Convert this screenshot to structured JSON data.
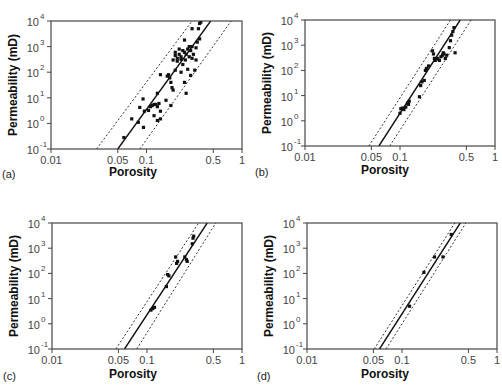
{
  "figure": {
    "panels": [
      {
        "id": "a",
        "label": "(a)",
        "box": {
          "left": 51,
          "top": 21,
          "right": 242,
          "bottom": 149
        },
        "label_pos": {
          "x": 2,
          "y": 178
        },
        "xtitle_pos": {
          "x": 133,
          "y": 176
        }
      },
      {
        "id": "b",
        "label": "(b)",
        "box": {
          "left": 305,
          "top": 20,
          "right": 495,
          "bottom": 146
        },
        "label_pos": {
          "x": 255,
          "y": 176
        },
        "xtitle_pos": {
          "x": 385,
          "y": 174
        }
      },
      {
        "id": "c",
        "label": "(c)",
        "box": {
          "left": 52,
          "top": 223,
          "right": 242,
          "bottom": 349
        },
        "label_pos": {
          "x": 3,
          "y": 380
        },
        "xtitle_pos": {
          "x": 133,
          "y": 378
        }
      },
      {
        "id": "d",
        "label": "(d)",
        "box": {
          "left": 307,
          "top": 223,
          "right": 497,
          "bottom": 349
        },
        "label_pos": {
          "x": 257,
          "y": 380
        },
        "xtitle_pos": {
          "x": 385,
          "y": 378
        }
      }
    ]
  },
  "chart_data": [
    {
      "type": "scatter",
      "panel": "(a)",
      "title": "",
      "xlabel": "Porosity",
      "ylabel": "Permeability (mD)",
      "xscale": "log",
      "yscale": "log",
      "xlim": [
        0.01,
        1
      ],
      "ylim": [
        0.1,
        10000
      ],
      "xticks": [
        0.01,
        0.05,
        0.1,
        0.5,
        1
      ],
      "xtick_labels": [
        "0.01",
        "0.05",
        "0.1",
        "0.5",
        "1"
      ],
      "yticks": [
        0.1,
        1,
        10,
        100,
        1000,
        10000
      ],
      "ytick_labels": [
        {
          "base": "10",
          "exp": "-1"
        },
        {
          "base": "10",
          "exp": "0"
        },
        {
          "base": "10",
          "exp": "1"
        },
        {
          "base": "10",
          "exp": "2"
        },
        {
          "base": "10",
          "exp": "3"
        },
        {
          "base": "10",
          "exp": "4"
        }
      ],
      "grid": false,
      "fit_line": {
        "points": [
          [
            0.05,
            0.1
          ],
          [
            0.47,
            10000
          ]
        ],
        "style": "solid"
      },
      "bounds": [
        {
          "points": [
            [
              0.03,
              0.1
            ],
            [
              0.3,
              10000
            ]
          ],
          "style": "dotted"
        },
        {
          "points": [
            [
              0.085,
              0.1
            ],
            [
              0.77,
              10000
            ]
          ],
          "style": "dotted"
        }
      ],
      "points": [
        [
          0.058,
          0.28
        ],
        [
          0.07,
          1.5
        ],
        [
          0.082,
          1.1
        ],
        [
          0.085,
          4.2
        ],
        [
          0.092,
          9
        ],
        [
          0.093,
          0.7
        ],
        [
          0.095,
          3
        ],
        [
          0.105,
          3.2
        ],
        [
          0.11,
          4.5
        ],
        [
          0.115,
          5
        ],
        [
          0.12,
          2
        ],
        [
          0.12,
          5.5
        ],
        [
          0.125,
          5.5
        ],
        [
          0.13,
          15
        ],
        [
          0.13,
          1.3
        ],
        [
          0.13,
          4.5
        ],
        [
          0.135,
          6
        ],
        [
          0.14,
          1.5
        ],
        [
          0.14,
          3
        ],
        [
          0.14,
          80
        ],
        [
          0.16,
          8
        ],
        [
          0.165,
          70
        ],
        [
          0.17,
          80
        ],
        [
          0.175,
          60
        ],
        [
          0.18,
          40
        ],
        [
          0.18,
          5
        ],
        [
          0.185,
          25
        ],
        [
          0.19,
          20
        ],
        [
          0.19,
          300
        ],
        [
          0.2,
          450
        ],
        [
          0.2,
          600
        ],
        [
          0.2,
          120
        ],
        [
          0.21,
          350
        ],
        [
          0.21,
          270
        ],
        [
          0.22,
          500
        ],
        [
          0.22,
          800
        ],
        [
          0.23,
          400
        ],
        [
          0.23,
          320
        ],
        [
          0.23,
          100
        ],
        [
          0.24,
          200
        ],
        [
          0.24,
          700
        ],
        [
          0.25,
          1800
        ],
        [
          0.25,
          600
        ],
        [
          0.25,
          40
        ],
        [
          0.255,
          300
        ],
        [
          0.26,
          500
        ],
        [
          0.26,
          15
        ],
        [
          0.27,
          130
        ],
        [
          0.27,
          800
        ],
        [
          0.28,
          1000
        ],
        [
          0.28,
          400
        ],
        [
          0.29,
          700
        ],
        [
          0.29,
          75
        ],
        [
          0.3,
          5000
        ],
        [
          0.3,
          1000
        ],
        [
          0.3,
          350
        ],
        [
          0.31,
          500
        ],
        [
          0.32,
          120
        ],
        [
          0.33,
          300
        ],
        [
          0.33,
          900
        ],
        [
          0.34,
          1500
        ],
        [
          0.35,
          5000
        ],
        [
          0.36,
          8000
        ],
        [
          0.37,
          9000
        ],
        [
          0.36,
          2000
        ]
      ]
    },
    {
      "type": "scatter",
      "panel": "(b)",
      "xlabel": "Porosity",
      "ylabel": "Permeability (mD)",
      "xscale": "log",
      "yscale": "log",
      "xlim": [
        0.01,
        1
      ],
      "ylim": [
        0.1,
        10000
      ],
      "xticks": [
        0.01,
        0.05,
        0.1,
        0.5,
        1
      ],
      "xtick_labels": [
        "0.01",
        "0.05",
        "0.1",
        "0.5",
        "1"
      ],
      "yticks": [
        0.1,
        1,
        10,
        100,
        1000,
        10000
      ],
      "ytick_labels": [
        {
          "base": "10",
          "exp": "-1"
        },
        {
          "base": "10",
          "exp": "0"
        },
        {
          "base": "10",
          "exp": "1"
        },
        {
          "base": "10",
          "exp": "2"
        },
        {
          "base": "10",
          "exp": "3"
        },
        {
          "base": "10",
          "exp": "4"
        }
      ],
      "grid": false,
      "fit_line": {
        "points": [
          [
            0.06,
            0.1
          ],
          [
            0.43,
            10000
          ]
        ],
        "style": "solid"
      },
      "bounds": [
        {
          "points": [
            [
              0.047,
              0.1
            ],
            [
              0.34,
              10000
            ]
          ],
          "style": "dotted"
        },
        {
          "points": [
            [
              0.078,
              0.1
            ],
            [
              0.56,
              10000
            ]
          ],
          "style": "dotted"
        }
      ],
      "points": [
        [
          0.1,
          2
        ],
        [
          0.102,
          3
        ],
        [
          0.106,
          3.2
        ],
        [
          0.11,
          2.8
        ],
        [
          0.115,
          3.5
        ],
        [
          0.12,
          5
        ],
        [
          0.123,
          4.5
        ],
        [
          0.125,
          6
        ],
        [
          0.16,
          9
        ],
        [
          0.165,
          25
        ],
        [
          0.17,
          35
        ],
        [
          0.18,
          40
        ],
        [
          0.185,
          100
        ],
        [
          0.19,
          120
        ],
        [
          0.2,
          150
        ],
        [
          0.22,
          600
        ],
        [
          0.225,
          450
        ],
        [
          0.23,
          300
        ],
        [
          0.235,
          250
        ],
        [
          0.24,
          280
        ],
        [
          0.25,
          300
        ],
        [
          0.26,
          250
        ],
        [
          0.27,
          350
        ],
        [
          0.28,
          400
        ],
        [
          0.285,
          500
        ],
        [
          0.29,
          450
        ],
        [
          0.3,
          300
        ],
        [
          0.31,
          400
        ],
        [
          0.33,
          800
        ],
        [
          0.34,
          1500
        ],
        [
          0.35,
          2500
        ],
        [
          0.36,
          3500
        ],
        [
          0.37,
          5000
        ],
        [
          0.38,
          500
        ]
      ]
    },
    {
      "type": "scatter",
      "panel": "(c)",
      "xlabel": "Porosity",
      "ylabel": "Permeability (mD)",
      "xscale": "log",
      "yscale": "log",
      "xlim": [
        0.01,
        1
      ],
      "ylim": [
        0.1,
        10000
      ],
      "xticks": [
        0.01,
        0.05,
        0.1,
        0.5,
        1
      ],
      "xtick_labels": [
        "0.01",
        "0.05",
        "0.1",
        "0.5",
        "1"
      ],
      "yticks": [
        0.1,
        1,
        10,
        100,
        1000,
        10000
      ],
      "ytick_labels": [
        {
          "base": "10",
          "exp": "-1"
        },
        {
          "base": "10",
          "exp": "0"
        },
        {
          "base": "10",
          "exp": "1"
        },
        {
          "base": "10",
          "exp": "2"
        },
        {
          "base": "10",
          "exp": "3"
        },
        {
          "base": "10",
          "exp": "4"
        }
      ],
      "grid": false,
      "fit_line": {
        "points": [
          [
            0.058,
            0.1
          ],
          [
            0.43,
            10000
          ]
        ],
        "style": "solid"
      },
      "bounds": [
        {
          "points": [
            [
              0.047,
              0.1
            ],
            [
              0.35,
              10000
            ]
          ],
          "style": "dotted"
        },
        {
          "points": [
            [
              0.078,
              0.1
            ],
            [
              0.53,
              10000
            ]
          ],
          "style": "dotted"
        }
      ],
      "points": [
        [
          0.11,
          3.5
        ],
        [
          0.115,
          4
        ],
        [
          0.12,
          4.5
        ],
        [
          0.16,
          30
        ],
        [
          0.165,
          90
        ],
        [
          0.17,
          80
        ],
        [
          0.2,
          450
        ],
        [
          0.205,
          250
        ],
        [
          0.21,
          300
        ],
        [
          0.25,
          450
        ],
        [
          0.26,
          350
        ],
        [
          0.265,
          300
        ],
        [
          0.3,
          1500
        ],
        [
          0.305,
          2500
        ],
        [
          0.31,
          3000
        ]
      ]
    },
    {
      "type": "scatter",
      "panel": "(d)",
      "xlabel": "Porosity",
      "ylabel": "Permeability (mD)",
      "xscale": "log",
      "yscale": "log",
      "xlim": [
        0.01,
        1
      ],
      "ylim": [
        0.1,
        10000
      ],
      "xticks": [
        0.01,
        0.05,
        0.1,
        0.5,
        1
      ],
      "xtick_labels": [
        "0.01",
        "0.05",
        "0.1",
        "0.5",
        "1"
      ],
      "yticks": [
        0.1,
        1,
        10,
        100,
        1000,
        10000
      ],
      "ytick_labels": [
        {
          "base": "10",
          "exp": "-1"
        },
        {
          "base": "10",
          "exp": "0"
        },
        {
          "base": "10",
          "exp": "1"
        },
        {
          "base": "10",
          "exp": "2"
        },
        {
          "base": "10",
          "exp": "3"
        },
        {
          "base": "10",
          "exp": "4"
        }
      ],
      "grid": false,
      "fit_line": {
        "points": [
          [
            0.058,
            0.1
          ],
          [
            0.41,
            10000
          ]
        ],
        "style": "solid"
      },
      "bounds": [
        {
          "points": [
            [
              0.051,
              0.1
            ],
            [
              0.36,
              10000
            ]
          ],
          "style": "dotted"
        },
        {
          "points": [
            [
              0.068,
              0.1
            ],
            [
              0.47,
              10000
            ]
          ],
          "style": "dotted"
        }
      ],
      "points": [
        [
          0.12,
          5
        ],
        [
          0.17,
          110
        ],
        [
          0.22,
          450
        ],
        [
          0.27,
          450
        ],
        [
          0.33,
          3500
        ]
      ]
    }
  ]
}
